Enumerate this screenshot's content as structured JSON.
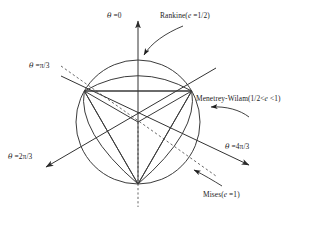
{
  "figure": {
    "type": "deviatoric-plane-yield-surface-diagram",
    "center": {
      "x": 138,
      "y": 122
    },
    "radius": 62,
    "stroke_color": "#333333",
    "background_color": "#ffffff"
  },
  "axes": [
    {
      "id": "theta-0",
      "label_text": "θ =0",
      "theta_deg": 0,
      "style": "solid-up-dashed-down",
      "arrow": "top"
    },
    {
      "id": "theta-pi-3",
      "label_text": "θ =π/3",
      "theta_deg": 60,
      "style": "dashed",
      "arrow": "none"
    },
    {
      "id": "theta-2pi-3",
      "label_text": "θ =2π/3",
      "theta_deg": 120,
      "style": "solid",
      "arrow": "lower-left"
    },
    {
      "id": "theta-4pi-3",
      "label_text": "θ =4π/3",
      "theta_deg": 240,
      "style": "solid",
      "arrow": "lower-right"
    }
  ],
  "labels": {
    "theta_0": {
      "prefix": "θ",
      "value": " =0"
    },
    "theta_pi_3": {
      "prefix": "θ",
      "value": " =π/3"
    },
    "theta_2pi_3": {
      "prefix": "θ",
      "value": " =2π/3"
    },
    "theta_4pi_3": {
      "prefix": "θ",
      "value": " =4π/3"
    }
  },
  "curves": [
    {
      "id": "rankine",
      "name": "Rankine",
      "label_text": "Rankine(e =1/2)",
      "eccentricity_text": "e =1/2",
      "eccentricity": 0.5,
      "shape": "triangle",
      "callout": "curved-arrow-to-upper-arc"
    },
    {
      "id": "menetrey-wilam",
      "name": "Menetrey-Wilam",
      "label_text": "Menetrey-Wilam(1/2< e <1)",
      "eccentricity_text": "1/2< e <1",
      "eccentricity_range": [
        0.5,
        1.0
      ],
      "shape": "rounded-triangle",
      "callout": "curved-arrow-to-right-side"
    },
    {
      "id": "mises",
      "name": "Mises",
      "label_text": "Mises(e =1)",
      "eccentricity_text": "e =1",
      "eccentricity": 1.0,
      "shape": "circle",
      "callout": "curved-arrow-to-lower-right-arc"
    }
  ],
  "callout_labels": {
    "rankine": {
      "name": "Rankine",
      "open": "(",
      "ital": "e",
      "rest": " =1/2)"
    },
    "menetrey": {
      "name": "Menetrey-Wilam",
      "open": "(",
      "pre": "1/2<",
      "ital": "e",
      "rest": " <1)"
    },
    "mises": {
      "name": "Mises",
      "open": "(",
      "ital": "e",
      "rest": " =1)"
    }
  }
}
